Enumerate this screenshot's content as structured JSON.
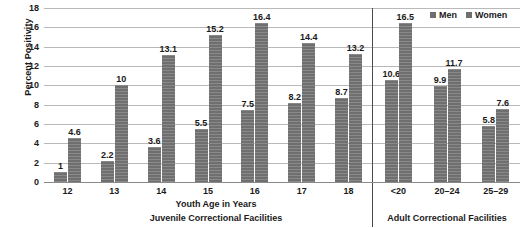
{
  "chart_data": {
    "type": "bar",
    "title": "",
    "xlabel": "Youth Age in Years",
    "ylabel": "Percent Positivity",
    "ylim": [
      0,
      18
    ],
    "ytick_step": 2,
    "yticks": [
      0,
      2,
      4,
      6,
      8,
      10,
      12,
      14,
      16,
      18
    ],
    "grid": true,
    "legend_position": "top-right",
    "categories": [
      "12",
      "13",
      "14",
      "15",
      "16",
      "17",
      "18",
      "<20",
      "20–24",
      "25–29"
    ],
    "series": [
      {
        "name": "Men",
        "values": [
          1,
          2.2,
          3.6,
          5.5,
          7.5,
          8.2,
          8.7,
          10.6,
          9.9,
          5.8
        ]
      },
      {
        "name": "Women",
        "values": [
          4.6,
          10,
          13.1,
          15.2,
          16.4,
          14.4,
          13.2,
          16.5,
          11.7,
          7.6
        ]
      }
    ],
    "sections": [
      {
        "label": "Juvenile Correctional Facilities",
        "categories": [
          "12",
          "13",
          "14",
          "15",
          "16",
          "17",
          "18"
        ]
      },
      {
        "label": "Adult Correctional Facilities",
        "categories": [
          "<20",
          "20–24",
          "25–29"
        ]
      }
    ],
    "bar_color": "#6f6f6f",
    "grid_color": "#b9b9b9",
    "axis_color": "#4a4a4a"
  },
  "legend": {
    "items": [
      {
        "label": "Men"
      },
      {
        "label": "Women"
      }
    ]
  },
  "axis": {
    "y_title": "Percent Positivity",
    "x_title": "Youth Age in Years"
  },
  "sections": {
    "juvenile_label": "Juvenile Correctional Facilities",
    "adult_label": "Adult Correctional Facilities"
  }
}
